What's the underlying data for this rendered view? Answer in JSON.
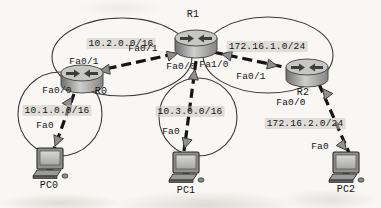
{
  "topology": {
    "type": "network-diagram",
    "routers": [
      {
        "name": "R0"
      },
      {
        "name": "R1"
      },
      {
        "name": "R2"
      }
    ],
    "pcs": [
      {
        "name": "PC0"
      },
      {
        "name": "PC1"
      },
      {
        "name": "PC2"
      }
    ],
    "networks": {
      "r0_r1": {
        "label": "10.2.0.0/16"
      },
      "r1_r2": {
        "label": "172.16.1.0/24"
      },
      "r0_lan": {
        "label": "10.1.0.0/16"
      },
      "r1_lan": {
        "label": "10.3.0.0/16"
      },
      "r2_lan": {
        "label": "172.16.2.0/24"
      }
    },
    "interfaces": {
      "r0_fa00": "Fa0/0",
      "r0_fa01": "Fa0/1",
      "r1_fa01": "Fa0/1",
      "r1_fa00": "Fa0/0",
      "r1_fa10": "Fa1/0",
      "r2_fa01": "Fa0/1",
      "r2_fa00": "Fa0/0",
      "pc0_fa0": "Fa0",
      "pc1_fa0": "Fa0",
      "pc2_fa0": "Fa0"
    },
    "links": [
      {
        "from": "R0",
        "to": "R1"
      },
      {
        "from": "R1",
        "to": "R2"
      },
      {
        "from": "R0",
        "to": "PC0"
      },
      {
        "from": "R1",
        "to": "PC1"
      },
      {
        "from": "R2",
        "to": "PC2"
      }
    ],
    "colors": {
      "background": "#f8f7f3",
      "link": "#141414",
      "ellipse_stroke": "#3a3a3a",
      "triangle_fill": "#8f8f8f",
      "router_top": "#c6c6c4",
      "router_body": "#9c9c9c",
      "pc_screen": "#c2c2c0",
      "text": "#151515",
      "network_label_bg": "#cbc8c0"
    }
  }
}
